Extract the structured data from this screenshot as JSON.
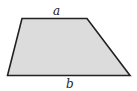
{
  "figure": {
    "shape": "trapezoid",
    "fill": "#dcdcdc",
    "stroke": "#222222",
    "labels": {
      "top": "a",
      "bottom": "b"
    }
  }
}
